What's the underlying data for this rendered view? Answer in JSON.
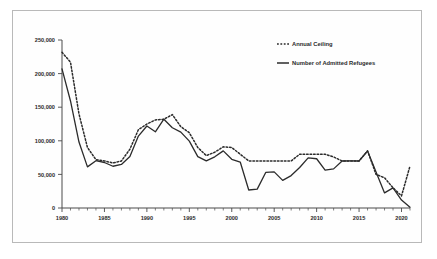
{
  "figure": {
    "background_color": "#ffffff",
    "frame_color": "#b9b9b9",
    "line_color": "#2b2b2b"
  },
  "chart_data": {
    "type": "line",
    "title": "",
    "subtitle": "",
    "xlabel": "",
    "ylabel": "",
    "xlim": [
      1980,
      2021
    ],
    "ylim": [
      0,
      250000
    ],
    "grid": false,
    "legend_position": "top-right",
    "y_ticks": [
      0,
      50000,
      100000,
      150000,
      200000,
      250000
    ],
    "y_tick_labels": [
      "0",
      "50,000",
      "100,000",
      "150,000",
      "200,000",
      "250,000"
    ],
    "x_ticks": [
      1980,
      1985,
      1990,
      1995,
      2000,
      2005,
      2010,
      2015,
      2020
    ],
    "x_tick_labels": [
      "1980",
      "1985",
      "1990",
      "1995",
      "2000",
      "2005",
      "2010",
      "2015",
      "2020"
    ],
    "x_minor_tick_step": 1,
    "x": [
      1980,
      1981,
      1982,
      1983,
      1984,
      1985,
      1986,
      1987,
      1988,
      1989,
      1990,
      1991,
      1992,
      1993,
      1994,
      1995,
      1996,
      1997,
      1998,
      1999,
      2000,
      2001,
      2002,
      2003,
      2004,
      2005,
      2006,
      2007,
      2008,
      2009,
      2010,
      2011,
      2012,
      2013,
      2014,
      2015,
      2016,
      2017,
      2018,
      2019,
      2020,
      2021
    ],
    "series": [
      {
        "name": "Annual Ceiling",
        "style": "dashed",
        "values": [
          231700,
          217000,
          140000,
          90000,
          72000,
          70000,
          67000,
          70000,
          87500,
          116500,
          125000,
          131000,
          132000,
          139000,
          121000,
          112000,
          90000,
          78000,
          83000,
          91000,
          90000,
          80000,
          70000,
          70000,
          70000,
          70000,
          70000,
          70000,
          80000,
          80000,
          80000,
          80000,
          76000,
          70000,
          70000,
          70000,
          85000,
          50000,
          45000,
          30000,
          18000,
          62500
        ]
      },
      {
        "name": "Number of Admitted Refugees",
        "style": "solid",
        "values": [
          207116,
          159252,
          98096,
          61218,
          70393,
          67704,
          62146,
          64828,
          76483,
          107000,
          122066,
          113389,
          132173,
          119448,
          112981,
          99490,
          76403,
          70085,
          76181,
          85010,
          72515,
          68426,
          26788,
          28117,
          52868,
          53738,
          41094,
          48281,
          60191,
          74654,
          73311,
          56424,
          58238,
          69926,
          69987,
          69933,
          84994,
          53716,
          22491,
          30000,
          11814,
          1000
        ]
      }
    ]
  },
  "legend": {
    "items": [
      {
        "label": "Annual Ceiling",
        "style": "dashed"
      },
      {
        "label": "Number of Admitted Refugees",
        "style": "solid"
      }
    ]
  }
}
